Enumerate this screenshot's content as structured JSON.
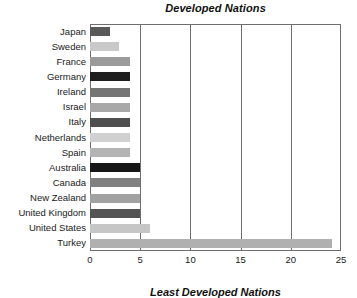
{
  "chart_data": {
    "type": "bar",
    "orientation": "horizontal",
    "title": "Developed Nations",
    "xlabel": "",
    "ylabel": "",
    "xlim": [
      0,
      25
    ],
    "ylim": null,
    "grid": true,
    "legend": null,
    "xticks": [
      "0",
      "5",
      "10",
      "15",
      "20",
      "25"
    ],
    "xtick_values": [
      0,
      5,
      10,
      15,
      20,
      25
    ],
    "categories": [
      "Japan",
      "Sweden",
      "France",
      "Germany",
      "Ireland",
      "Israel",
      "Italy",
      "Netherlands",
      "Spain",
      "Australia",
      "Canada",
      "New Zealand",
      "United Kingdom",
      "United States",
      "Turkey"
    ],
    "values": [
      2.0,
      2.9,
      4.0,
      4.0,
      4.0,
      4.0,
      4.0,
      4.0,
      4.0,
      5.0,
      5.0,
      5.0,
      5.0,
      6.0,
      24.1
    ],
    "bar_colors": [
      "#5a5a5a",
      "#c9c9c9",
      "#9a9a9a",
      "#1f1f1f",
      "#757575",
      "#a8a8a8",
      "#4f4f4f",
      "#d0d0d0",
      "#b4b4b4",
      "#161616",
      "#808080",
      "#a2a2a2",
      "#545454",
      "#c6c6c6",
      "#b0b0b0"
    ]
  },
  "caption": {
    "bottom_partial": "Least Developed Nations"
  },
  "colors": {
    "axis": "#6e6e6e",
    "text": "#1a1a1a",
    "background": "#ffffff"
  }
}
